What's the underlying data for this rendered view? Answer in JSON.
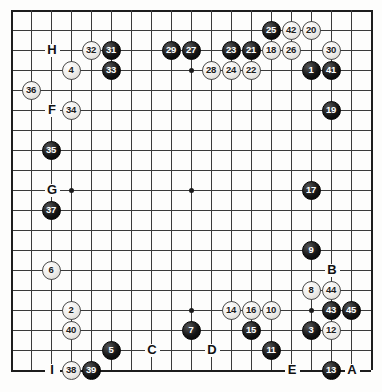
{
  "diagram": {
    "kind": "go-board-diagram",
    "board_size": 19,
    "grid": {
      "origin_x": 11,
      "origin_y": 10,
      "spacing": 20,
      "cols": 18,
      "rows": 19
    },
    "star_points": [
      {
        "col": 3,
        "row": 3
      },
      {
        "col": 3,
        "row": 9
      },
      {
        "col": 3,
        "row": 15
      },
      {
        "col": 9,
        "row": 3
      },
      {
        "col": 9,
        "row": 9
      },
      {
        "col": 9,
        "row": 15
      },
      {
        "col": 15,
        "row": 3
      },
      {
        "col": 15,
        "row": 9
      },
      {
        "col": 15,
        "row": 15
      }
    ],
    "stones": [
      {
        "label": "25",
        "color": "black",
        "col": 13,
        "row": 1
      },
      {
        "label": "42",
        "color": "white",
        "col": 14,
        "row": 1
      },
      {
        "label": "20",
        "color": "white",
        "col": 15,
        "row": 1
      },
      {
        "label": "32",
        "color": "white",
        "col": 4,
        "row": 2
      },
      {
        "label": "31",
        "color": "black",
        "col": 5,
        "row": 2
      },
      {
        "label": "29",
        "color": "black",
        "col": 8,
        "row": 2
      },
      {
        "label": "27",
        "color": "black",
        "col": 9,
        "row": 2
      },
      {
        "label": "23",
        "color": "black",
        "col": 11,
        "row": 2
      },
      {
        "label": "21",
        "color": "black",
        "col": 12,
        "row": 2
      },
      {
        "label": "18",
        "color": "white",
        "col": 13,
        "row": 2
      },
      {
        "label": "26",
        "color": "white",
        "col": 14,
        "row": 2
      },
      {
        "label": "30",
        "color": "white",
        "col": 16,
        "row": 2
      },
      {
        "label": "4",
        "color": "white",
        "col": 3,
        "row": 3
      },
      {
        "label": "33",
        "color": "black",
        "col": 5,
        "row": 3
      },
      {
        "label": "28",
        "color": "white",
        "col": 10,
        "row": 3
      },
      {
        "label": "24",
        "color": "white",
        "col": 11,
        "row": 3
      },
      {
        "label": "22",
        "color": "white",
        "col": 12,
        "row": 3
      },
      {
        "label": "1",
        "color": "black",
        "col": 15,
        "row": 3
      },
      {
        "label": "41",
        "color": "black",
        "col": 16,
        "row": 3
      },
      {
        "label": "36",
        "color": "white",
        "col": 1,
        "row": 4
      },
      {
        "label": "34",
        "color": "white",
        "col": 3,
        "row": 5
      },
      {
        "label": "19",
        "color": "black",
        "col": 16,
        "row": 5
      },
      {
        "label": "35",
        "color": "black",
        "col": 2,
        "row": 7
      },
      {
        "label": "17",
        "color": "black",
        "col": 15,
        "row": 9
      },
      {
        "label": "37",
        "color": "black",
        "col": 2,
        "row": 10
      },
      {
        "label": "9",
        "color": "black",
        "col": 15,
        "row": 12
      },
      {
        "label": "6",
        "color": "white",
        "col": 2,
        "row": 13
      },
      {
        "label": "8",
        "color": "white",
        "col": 15,
        "row": 14
      },
      {
        "label": "44",
        "color": "white",
        "col": 16,
        "row": 14
      },
      {
        "label": "14",
        "color": "white",
        "col": 11,
        "row": 15
      },
      {
        "label": "16",
        "color": "white",
        "col": 12,
        "row": 15
      },
      {
        "label": "10",
        "color": "white",
        "col": 13,
        "row": 15
      },
      {
        "label": "43",
        "color": "black",
        "col": 16,
        "row": 15
      },
      {
        "label": "45",
        "color": "black",
        "col": 17,
        "row": 15
      },
      {
        "label": "2",
        "color": "white",
        "col": 3,
        "row": 15
      },
      {
        "label": "7",
        "color": "black",
        "col": 9,
        "row": 16
      },
      {
        "label": "15",
        "color": "black",
        "col": 12,
        "row": 16
      },
      {
        "label": "3",
        "color": "black",
        "col": 15,
        "row": 16
      },
      {
        "label": "12",
        "color": "white",
        "col": 16,
        "row": 16
      },
      {
        "label": "40",
        "color": "white",
        "col": 3,
        "row": 16
      },
      {
        "label": "5",
        "color": "black",
        "col": 5,
        "row": 17
      },
      {
        "label": "11",
        "color": "black",
        "col": 13,
        "row": 17
      },
      {
        "label": "38",
        "color": "white",
        "col": 3,
        "row": 18
      },
      {
        "label": "39",
        "color": "black",
        "col": 4,
        "row": 18
      },
      {
        "label": "13",
        "color": "black",
        "col": 16,
        "row": 18
      }
    ],
    "markers": [
      {
        "label": "H",
        "col": 2,
        "row": 2
      },
      {
        "label": "F",
        "col": 2,
        "row": 5
      },
      {
        "label": "G",
        "col": 2,
        "row": 9
      },
      {
        "label": "B",
        "col": 16,
        "row": 13
      },
      {
        "label": "C",
        "col": 7,
        "row": 17
      },
      {
        "label": "D",
        "col": 10,
        "row": 17
      },
      {
        "label": "E",
        "col": 14,
        "row": 18
      },
      {
        "label": "A",
        "col": 17,
        "row": 18
      },
      {
        "label": "I",
        "col": 2,
        "row": 18
      }
    ]
  }
}
